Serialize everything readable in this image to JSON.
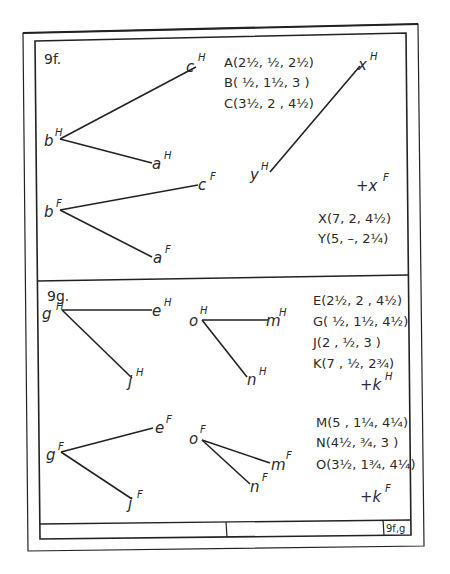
{
  "sheet": {
    "sheet_number": "9f,g"
  },
  "problem_9f": {
    "title": "9f.",
    "points": [
      {
        "name": "A",
        "coords": "A(2½, ½, 2½)"
      },
      {
        "name": "B",
        "coords": "B( ½, 1½, 3 )"
      },
      {
        "name": "C",
        "coords": "C(3½, 2 , 4½)"
      }
    ],
    "xy_points": [
      {
        "name": "X",
        "coords": "X(7, 2, 4½)"
      },
      {
        "name": "Y",
        "coords": "Y(5, –, 2¼)"
      }
    ],
    "labels": {
      "cH": "c",
      "bH": "b",
      "aH": "a",
      "cF": "c",
      "bF": "b",
      "aF": "a",
      "xH": "x",
      "yH": "y",
      "xF": "+x",
      "H": "H",
      "F": "F"
    }
  },
  "problem_9g": {
    "title": "9g.",
    "points_1": [
      {
        "name": "E",
        "coords": "E(2½, 2 , 4½)"
      },
      {
        "name": "G",
        "coords": "G( ½, 1½, 4½)"
      },
      {
        "name": "J",
        "coords": "J(2 , ½, 3 )"
      },
      {
        "name": "K",
        "coords": "K(7 , ½, 2¾)"
      }
    ],
    "points_2": [
      {
        "name": "M",
        "coords": "M(5 , 1¼, 4¼)"
      },
      {
        "name": "N",
        "coords": "N(4½, ¾, 3 )"
      },
      {
        "name": "O",
        "coords": "O(3½, 1¾, 4¼)"
      }
    ],
    "labels": {
      "g": "g",
      "e": "e",
      "j": "j",
      "o": "o",
      "m": "m",
      "n": "n",
      "kH": "+k",
      "kF": "+k",
      "H": "H",
      "F": "F"
    }
  }
}
